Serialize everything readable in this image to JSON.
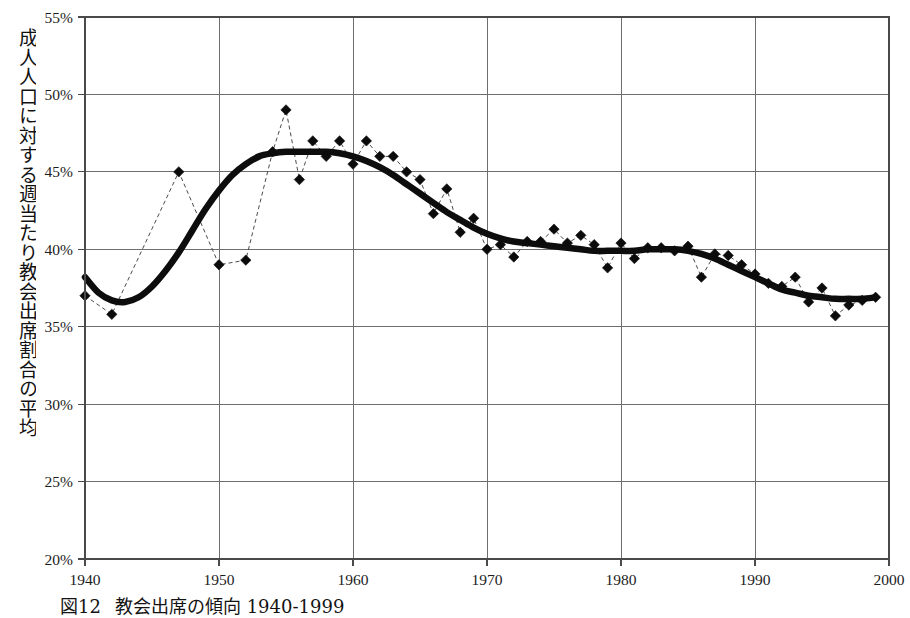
{
  "figure": {
    "caption_number": "図12",
    "caption_text": "教会出席の傾向 1940-1999",
    "y_axis_title": "成人人口に対する週当たり教会出席割合の平均"
  },
  "chart_data": {
    "type": "line",
    "title": "教会出席の傾向 1940-1999",
    "xlabel": "",
    "ylabel": "成人人口に対する週当たり教会出席割合の平均",
    "xlim": [
      1940,
      2000
    ],
    "ylim": [
      20,
      55
    ],
    "y_tick_labels": [
      "55%",
      "50%",
      "45%",
      "40%",
      "35%",
      "30%",
      "25%",
      "20%"
    ],
    "y_tick_values": [
      55,
      50,
      45,
      40,
      35,
      30,
      25,
      20
    ],
    "x_tick_labels": [
      "1940",
      "1950",
      "1960",
      "1970",
      "1980",
      "1990",
      "2000"
    ],
    "x_tick_values": [
      1940,
      1950,
      1960,
      1970,
      1980,
      1990,
      2000
    ],
    "grid": true,
    "legend": "none",
    "y_unit": "%",
    "series": [
      {
        "name": "年次観測値",
        "style": "dashed-with-diamond-markers",
        "marker": "diamond",
        "color": "#0b0b0b",
        "x": [
          1940,
          1942,
          1947,
          1950,
          1952,
          1954,
          1955,
          1956,
          1957,
          1958,
          1959,
          1960,
          1961,
          1962,
          1963,
          1964,
          1965,
          1966,
          1967,
          1968,
          1969,
          1970,
          1971,
          1972,
          1973,
          1974,
          1975,
          1976,
          1977,
          1978,
          1979,
          1980,
          1981,
          1982,
          1983,
          1984,
          1985,
          1986,
          1987,
          1988,
          1989,
          1990,
          1991,
          1992,
          1993,
          1994,
          1995,
          1996,
          1997,
          1998,
          1999
        ],
        "values": [
          37.0,
          35.8,
          45.0,
          39.0,
          39.3,
          46.3,
          49.0,
          44.5,
          47.0,
          46.0,
          47.0,
          45.5,
          47.0,
          46.0,
          46.0,
          45.0,
          44.5,
          42.3,
          43.9,
          41.1,
          42.0,
          40.0,
          40.3,
          39.5,
          40.5,
          40.5,
          41.3,
          40.4,
          40.9,
          40.3,
          38.8,
          40.4,
          39.4,
          40.1,
          40.1,
          39.9,
          40.2,
          38.2,
          39.7,
          39.6,
          39.0,
          38.4,
          37.8,
          37.6,
          38.2,
          36.6,
          37.5,
          35.7,
          36.4,
          36.7,
          36.9
        ]
      },
      {
        "name": "平滑化トレンド",
        "style": "thick-solid",
        "color": "#0d0d0d",
        "x": [
          1940,
          1941,
          1942,
          1943,
          1944,
          1945,
          1946,
          1947,
          1948,
          1949,
          1950,
          1951,
          1952,
          1953,
          1954,
          1955,
          1956,
          1957,
          1958,
          1959,
          1960,
          1961,
          1962,
          1963,
          1964,
          1965,
          1966,
          1967,
          1968,
          1969,
          1970,
          1971,
          1972,
          1973,
          1974,
          1975,
          1976,
          1977,
          1978,
          1979,
          1980,
          1981,
          1982,
          1983,
          1984,
          1985,
          1986,
          1987,
          1988,
          1989,
          1990,
          1991,
          1992,
          1993,
          1994,
          1995,
          1996,
          1997,
          1998,
          1999
        ],
        "values": [
          38.2,
          37.2,
          36.7,
          36.6,
          36.9,
          37.6,
          38.6,
          39.8,
          41.2,
          42.6,
          43.8,
          44.8,
          45.5,
          46.0,
          46.2,
          46.3,
          46.3,
          46.3,
          46.3,
          46.2,
          46.0,
          45.7,
          45.3,
          44.8,
          44.2,
          43.6,
          43.0,
          42.4,
          41.9,
          41.4,
          41.0,
          40.7,
          40.5,
          40.4,
          40.3,
          40.2,
          40.1,
          40.0,
          39.9,
          39.9,
          39.9,
          39.9,
          40.0,
          40.0,
          40.0,
          39.9,
          39.7,
          39.4,
          39.0,
          38.6,
          38.2,
          37.8,
          37.4,
          37.2,
          37.0,
          36.9,
          36.8,
          36.8,
          36.8,
          36.9
        ]
      }
    ]
  }
}
